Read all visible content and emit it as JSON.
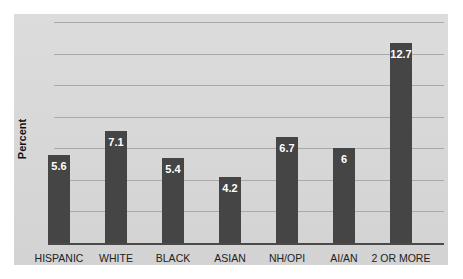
{
  "chart_data": {
    "type": "bar",
    "title": "",
    "xlabel": "",
    "ylabel": "Percent",
    "categories": [
      "HISPANIC",
      "WHITE",
      "BLACK",
      "ASIAN",
      "NH/OPI",
      "AI/AN",
      "2 OR MORE"
    ],
    "values": [
      5.6,
      7.1,
      5.4,
      4.2,
      6.7,
      6,
      12.7
    ],
    "value_labels": [
      "5.6",
      "7.1",
      "5.4",
      "4.2",
      "6.7",
      "6",
      "12.7"
    ],
    "ylim": [
      0,
      14
    ],
    "gridlines": [
      2,
      4,
      6,
      8,
      10,
      12,
      14
    ],
    "grid": true,
    "legend": null,
    "bar_color": "#454545",
    "background_color": "#d8d8d8"
  }
}
